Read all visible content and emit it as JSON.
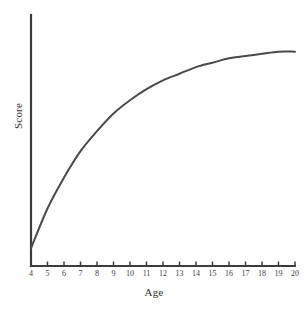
{
  "chart_data": {
    "type": "line",
    "title": "",
    "subtitle": "",
    "xlabel": "Age",
    "ylabel": "Score",
    "xlim": [
      4,
      20
    ],
    "ylim": [
      0,
      100
    ],
    "grid": false,
    "legend": false,
    "legend_position": "none",
    "x_tick_labels": [
      "4",
      "5",
      "6",
      "7",
      "8",
      "9",
      "10",
      "11",
      "12",
      "13",
      "14",
      "15",
      "16",
      "17",
      "18",
      "19",
      "20"
    ],
    "y_tick_labels": [],
    "annotations": [],
    "series": [
      {
        "name": "Score",
        "color": "#4a4a4a",
        "x": [
          4,
          5,
          6,
          7,
          8,
          9,
          10,
          11,
          12,
          13,
          14,
          15,
          16,
          17,
          18,
          19,
          20
        ],
        "values": [
          8,
          26,
          40,
          52,
          61,
          69,
          75,
          80,
          84,
          87,
          90,
          92,
          94,
          95,
          96,
          97,
          97
        ]
      }
    ]
  },
  "axes": {
    "x_title": "Age",
    "y_title": "Score",
    "axis_color": "#3c3c3c",
    "curve_color": "#4a4a4a"
  }
}
